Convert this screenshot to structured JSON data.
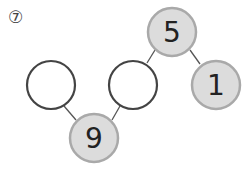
{
  "problem": {
    "marker": "⑦"
  },
  "nodes": [
    {
      "id": "top",
      "value": "5",
      "filled": true,
      "cx": 172,
      "cy": 32
    },
    {
      "id": "right",
      "value": "1",
      "filled": true,
      "cx": 216,
      "cy": 85
    },
    {
      "id": "middle",
      "value": "",
      "filled": false,
      "cx": 133,
      "cy": 85
    },
    {
      "id": "left",
      "value": "",
      "filled": false,
      "cx": 51,
      "cy": 85
    },
    {
      "id": "bottom",
      "value": "9",
      "filled": true,
      "cx": 94,
      "cy": 138
    }
  ],
  "colors": {
    "filled_fill": "#dcdcdc",
    "filled_stroke": "#a9a9a9",
    "empty_stroke": "#444444",
    "line": "#555555"
  }
}
